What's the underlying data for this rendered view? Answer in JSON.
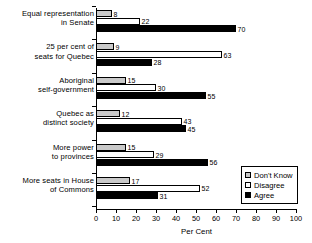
{
  "chart_data": {
    "type": "bar",
    "title": "",
    "xlabel": "Per Cent",
    "ylabel": "",
    "xlim": [
      0,
      100
    ],
    "grid": false,
    "orientation": "horizontal",
    "legend_position": "bottom-right",
    "xticks": [
      0,
      10,
      20,
      30,
      40,
      50,
      60,
      70,
      80,
      90,
      100
    ],
    "xticklabels": [
      "0",
      "10",
      "20",
      "30",
      "40",
      "50",
      "60",
      "70",
      "80",
      "90",
      "100"
    ],
    "categories": [
      "Equal representation in Senate",
      "25 per cent of seats for Quebec",
      "Aboriginal self-government",
      "Quebec as distinct society",
      "More power to provinces",
      "More seats in House of Commons"
    ],
    "category_lines": [
      [
        "Equal representation",
        "in Senate"
      ],
      [
        "25 per cent of",
        "seats for Quebec"
      ],
      [
        "Aboriginal",
        "self-government"
      ],
      [
        "Quebec as",
        "distinct society"
      ],
      [
        "More power",
        "to provinces"
      ],
      [
        "More seats in House",
        "of Commons"
      ]
    ],
    "series": [
      {
        "name": "Don't Know",
        "color": "#c9c9c9",
        "values": [
          8,
          9,
          15,
          12,
          15,
          17
        ]
      },
      {
        "name": "Disagree",
        "color": "#ffffff",
        "values": [
          22,
          63,
          30,
          43,
          29,
          52
        ]
      },
      {
        "name": "Agree",
        "color": "#000000",
        "values": [
          70,
          28,
          55,
          45,
          56,
          31
        ]
      }
    ]
  },
  "legend": {
    "items": [
      {
        "label": "Don't Know",
        "swatch": "dontknow"
      },
      {
        "label": "Disagree",
        "swatch": "disagree"
      },
      {
        "label": "Agree",
        "swatch": "agree"
      }
    ]
  }
}
